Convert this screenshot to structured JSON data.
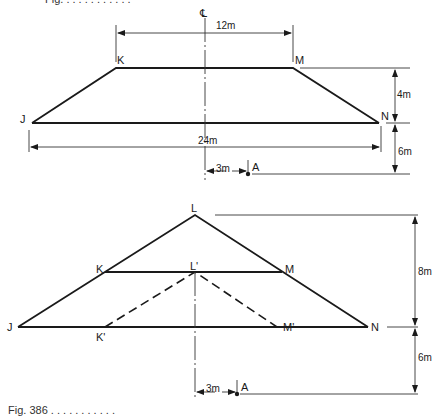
{
  "top_text_cut": "Fig. . . . . . . . . . . .",
  "caption": "Fig. 386 . . . . . . . . . . .",
  "upper_figure": {
    "centerline_symbol": "℄",
    "points": {
      "J": "J",
      "K": "K",
      "M": "M",
      "N": "N",
      "A": "A"
    },
    "dimensions": {
      "top_width": "12m",
      "base_width": "24m",
      "height": "4m",
      "depth_to_A": "6m",
      "offset_A": "3m"
    }
  },
  "lower_figure": {
    "points": {
      "L": "L",
      "L_prime": "L'",
      "K": "K",
      "M": "M",
      "J": "J",
      "N": "N",
      "K_prime": "K'",
      "M_prime": "M'",
      "A": "A"
    },
    "dimensions": {
      "height": "8m",
      "depth_to_A": "6m",
      "offset_A": "3m"
    }
  },
  "colors": {
    "line": "#1a1a1a",
    "thin": "#333333",
    "background": "#ffffff"
  }
}
